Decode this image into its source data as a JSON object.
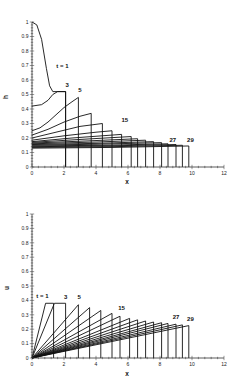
{
  "chart_data": [
    {
      "type": "line",
      "title": "",
      "xlabel": "x",
      "ylabel": "h",
      "xlim": [
        0,
        12
      ],
      "ylim": [
        0,
        1
      ],
      "xticks": [
        "0",
        "2",
        "4",
        "6",
        "8",
        "10",
        "12"
      ],
      "yticks": [
        "0",
        "0.1",
        "0.2",
        "0.3",
        "0.4",
        "0.5",
        "0.6",
        "0.7",
        "0.8",
        "0.9",
        "1"
      ],
      "grid": false,
      "legend": null,
      "annotations": [
        {
          "text": "t = 1",
          "x": 1.9,
          "y": 0.68
        },
        {
          "text": "3",
          "x": 2.2,
          "y": 0.55
        },
        {
          "text": "5",
          "x": 3.0,
          "y": 0.52
        },
        {
          "text": "15",
          "x": 5.8,
          "y": 0.31
        },
        {
          "text": "27",
          "x": 8.8,
          "y": 0.175
        },
        {
          "text": "29",
          "x": 9.9,
          "y": 0.17
        }
      ],
      "series": [
        {
          "name": "t=1",
          "x": [
            0,
            0.3,
            0.6,
            0.9,
            1.1,
            1.3,
            2.1,
            2.1
          ],
          "y": [
            1.0,
            0.98,
            0.88,
            0.68,
            0.56,
            0.52,
            0.52,
            0
          ]
        },
        {
          "name": "t=3",
          "x": [
            0,
            0.6,
            1.0,
            1.3,
            1.6,
            2.1,
            2.1
          ],
          "y": [
            0.42,
            0.43,
            0.46,
            0.5,
            0.52,
            0.52,
            0
          ]
        },
        {
          "name": "t=5",
          "x": [
            0,
            0.5,
            1.0,
            1.5,
            2.0,
            2.5,
            2.9,
            2.9
          ],
          "y": [
            0.25,
            0.27,
            0.31,
            0.36,
            0.41,
            0.45,
            0.48,
            0
          ]
        },
        {
          "name": "t=7",
          "x": [
            0,
            1.0,
            2.0,
            3.0,
            3.7,
            3.7
          ],
          "y": [
            0.22,
            0.26,
            0.31,
            0.35,
            0.37,
            0
          ]
        },
        {
          "name": "t=9",
          "x": [
            0,
            1.5,
            3.0,
            4.4,
            4.4
          ],
          "y": [
            0.2,
            0.24,
            0.28,
            0.3,
            0
          ]
        },
        {
          "name": "t=11",
          "x": [
            0,
            2.0,
            4.0,
            5.0,
            5.0
          ],
          "y": [
            0.185,
            0.215,
            0.24,
            0.25,
            0
          ]
        },
        {
          "name": "t=13",
          "x": [
            0,
            2.5,
            5.6,
            5.6
          ],
          "y": [
            0.175,
            0.2,
            0.225,
            0
          ]
        },
        {
          "name": "t=15",
          "x": [
            0,
            3.0,
            6.2,
            6.2
          ],
          "y": [
            0.17,
            0.19,
            0.21,
            0
          ]
        },
        {
          "name": "t=17",
          "x": [
            0,
            3.5,
            6.6,
            6.6
          ],
          "y": [
            0.165,
            0.18,
            0.195,
            0
          ]
        },
        {
          "name": "t=19",
          "x": [
            0,
            4.0,
            7.1,
            7.1
          ],
          "y": [
            0.16,
            0.172,
            0.185,
            0
          ]
        },
        {
          "name": "t=21",
          "x": [
            0,
            4.0,
            7.6,
            7.6
          ],
          "y": [
            0.155,
            0.163,
            0.175,
            0
          ]
        },
        {
          "name": "t=23",
          "x": [
            0,
            4.0,
            8.1,
            8.1
          ],
          "y": [
            0.15,
            0.157,
            0.168,
            0
          ]
        },
        {
          "name": "t=25",
          "x": [
            0,
            4.5,
            8.5,
            8.5
          ],
          "y": [
            0.145,
            0.15,
            0.16,
            0
          ]
        },
        {
          "name": "t=27",
          "x": [
            0,
            4.5,
            9.0,
            9.0
          ],
          "y": [
            0.14,
            0.145,
            0.155,
            0
          ]
        },
        {
          "name": "t=29",
          "x": [
            0,
            5.0,
            9.4,
            9.4
          ],
          "y": [
            0.135,
            0.14,
            0.15,
            0
          ]
        },
        {
          "name": "t=31",
          "x": [
            0,
            5.0,
            9.8,
            9.8
          ],
          "y": [
            0.13,
            0.135,
            0.145,
            0
          ]
        }
      ]
    },
    {
      "type": "line",
      "title": "",
      "xlabel": "x",
      "ylabel": "u",
      "xlim": [
        0,
        12
      ],
      "ylim": [
        0,
        1
      ],
      "xticks": [
        "0",
        "2",
        "4",
        "6",
        "8",
        "10",
        "12"
      ],
      "yticks": [
        "0",
        "0.1",
        "0.2",
        "0.3",
        "0.4",
        "0.5",
        "0.6",
        "0.7",
        "0.8",
        "0.9",
        "1"
      ],
      "grid": false,
      "legend": null,
      "annotations": [
        {
          "text": "t = 1",
          "x": 0.65,
          "y": 0.42
        },
        {
          "text": "3",
          "x": 2.1,
          "y": 0.41
        },
        {
          "text": "5",
          "x": 2.95,
          "y": 0.41
        },
        {
          "text": "15",
          "x": 5.6,
          "y": 0.33
        },
        {
          "text": "27",
          "x": 9.0,
          "y": 0.27
        },
        {
          "text": "29",
          "x": 9.9,
          "y": 0.255
        }
      ],
      "series": [
        {
          "name": "t=1",
          "x": [
            0,
            0.85,
            1.35,
            1.35
          ],
          "y": [
            0,
            0.38,
            0.38,
            0
          ]
        },
        {
          "name": "t=3",
          "x": [
            0,
            1.4,
            2.1,
            2.1
          ],
          "y": [
            0,
            0.38,
            0.38,
            0
          ]
        },
        {
          "name": "t=5",
          "x": [
            0,
            2.9,
            2.9
          ],
          "y": [
            0,
            0.37,
            0
          ]
        },
        {
          "name": "t=7",
          "x": [
            0,
            3.6,
            3.6
          ],
          "y": [
            0,
            0.35,
            0
          ]
        },
        {
          "name": "t=9",
          "x": [
            0,
            4.3,
            4.3
          ],
          "y": [
            0,
            0.33,
            0
          ]
        },
        {
          "name": "t=11",
          "x": [
            0,
            5.0,
            5.0
          ],
          "y": [
            0,
            0.31,
            0
          ]
        },
        {
          "name": "t=13",
          "x": [
            0,
            5.5,
            5.5
          ],
          "y": [
            0,
            0.29,
            0
          ]
        },
        {
          "name": "t=15",
          "x": [
            0,
            6.1,
            6.1
          ],
          "y": [
            0,
            0.275,
            0
          ]
        },
        {
          "name": "t=17",
          "x": [
            0,
            6.6,
            6.6
          ],
          "y": [
            0,
            0.265,
            0
          ]
        },
        {
          "name": "t=19",
          "x": [
            0,
            7.1,
            7.1
          ],
          "y": [
            0,
            0.257,
            0
          ]
        },
        {
          "name": "t=21",
          "x": [
            0,
            7.6,
            7.6
          ],
          "y": [
            0,
            0.25,
            0
          ]
        },
        {
          "name": "t=23",
          "x": [
            0,
            8.1,
            8.1
          ],
          "y": [
            0,
            0.245,
            0
          ]
        },
        {
          "name": "t=25",
          "x": [
            0,
            8.5,
            8.5
          ],
          "y": [
            0,
            0.24,
            0
          ]
        },
        {
          "name": "t=27",
          "x": [
            0,
            9.0,
            9.0
          ],
          "y": [
            0,
            0.235,
            0
          ]
        },
        {
          "name": "t=29",
          "x": [
            0,
            9.4,
            9.4
          ],
          "y": [
            0,
            0.23,
            0
          ]
        },
        {
          "name": "t=31",
          "x": [
            0,
            9.8,
            9.8
          ],
          "y": [
            0,
            0.225,
            0
          ]
        }
      ]
    }
  ],
  "layout": {
    "panels": [
      {
        "x0": 32,
        "x1": 224,
        "y0": 167,
        "y1": 22,
        "ylabel_x": 8,
        "ylabel_y": 97,
        "xlabel_y": 184
      },
      {
        "x0": 32,
        "x1": 224,
        "y0": 358,
        "y1": 214,
        "ylabel_x": 9,
        "ylabel_y": 288,
        "xlabel_y": 376
      }
    ],
    "line_color": "#111111",
    "axis_color": "#333333"
  }
}
